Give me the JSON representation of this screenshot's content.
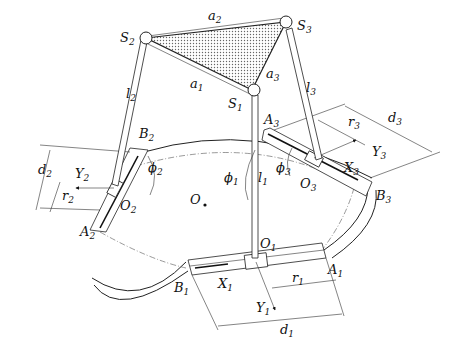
{
  "diagram": {
    "type": "parallel-mechanism-schematic",
    "platform": {
      "vertices": [
        {
          "id": "S1",
          "label": "S",
          "sub": "1"
        },
        {
          "id": "S2",
          "label": "S",
          "sub": "2"
        },
        {
          "id": "S3",
          "label": "S",
          "sub": "3"
        }
      ],
      "edges": [
        {
          "label": "a",
          "sub": "1"
        },
        {
          "label": "a",
          "sub": "2"
        },
        {
          "label": "a",
          "sub": "3"
        }
      ]
    },
    "links": [
      {
        "label": "l",
        "sub": "1"
      },
      {
        "label": "l",
        "sub": "2"
      },
      {
        "label": "l",
        "sub": "3"
      }
    ],
    "base": {
      "center": {
        "label": "O",
        "sub": ""
      },
      "guides": [
        {
          "A": {
            "label": "A",
            "sub": "1"
          },
          "B": {
            "label": "B",
            "sub": "1"
          },
          "O": {
            "label": "O",
            "sub": "1"
          },
          "X": {
            "label": "X",
            "sub": "1"
          },
          "Y": {
            "label": "Y",
            "sub": "1"
          },
          "r": {
            "label": "r",
            "sub": "1"
          },
          "d": {
            "label": "d",
            "sub": "1"
          },
          "phi": {
            "label": "ϕ",
            "sub": "1"
          }
        },
        {
          "A": {
            "label": "A",
            "sub": "2"
          },
          "B": {
            "label": "B",
            "sub": "2"
          },
          "O": {
            "label": "O",
            "sub": "2"
          },
          "Y": {
            "label": "Y",
            "sub": "2"
          },
          "r": {
            "label": "r",
            "sub": "2"
          },
          "d": {
            "label": "d",
            "sub": "2"
          },
          "phi": {
            "label": "ϕ",
            "sub": "2"
          }
        },
        {
          "A": {
            "label": "A",
            "sub": "3"
          },
          "B": {
            "label": "B",
            "sub": "3"
          },
          "O": {
            "label": "O",
            "sub": "3"
          },
          "X": {
            "label": "X",
            "sub": "3"
          },
          "Y": {
            "label": "Y",
            "sub": "3"
          },
          "r": {
            "label": "r",
            "sub": "3"
          },
          "d": {
            "label": "d",
            "sub": "3"
          },
          "phi": {
            "label": "ϕ",
            "sub": "3"
          }
        }
      ]
    }
  }
}
